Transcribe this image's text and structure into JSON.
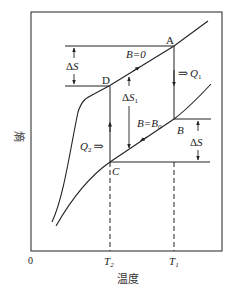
{
  "figure": {
    "y_axis_label": "熵",
    "x_axis_label": "温度",
    "origin_label": "0",
    "x_ticks": [
      {
        "base": "T",
        "sub": "2"
      },
      {
        "base": "T",
        "sub": "1"
      }
    ]
  },
  "points": {
    "A": "A",
    "B": "B",
    "C": "C",
    "D": "D"
  },
  "curves": {
    "upper": "B=0",
    "lower_base": "B=B",
    "lower_sub": "0"
  },
  "annotations": {
    "delta_s_top": {
      "delta": "Δ",
      "var": "S"
    },
    "delta_s_right": {
      "delta": "Δ",
      "var": "S"
    },
    "delta_s1": {
      "delta": "Δ",
      "var": "S",
      "sub": "1"
    },
    "q1": {
      "arrow": "⇒",
      "var": "Q",
      "sub": "1"
    },
    "q2": {
      "var": "Q",
      "sub": "2",
      "arrow": "⇒"
    }
  },
  "colors": {
    "line": "#222222",
    "background": "#ffffff"
  }
}
